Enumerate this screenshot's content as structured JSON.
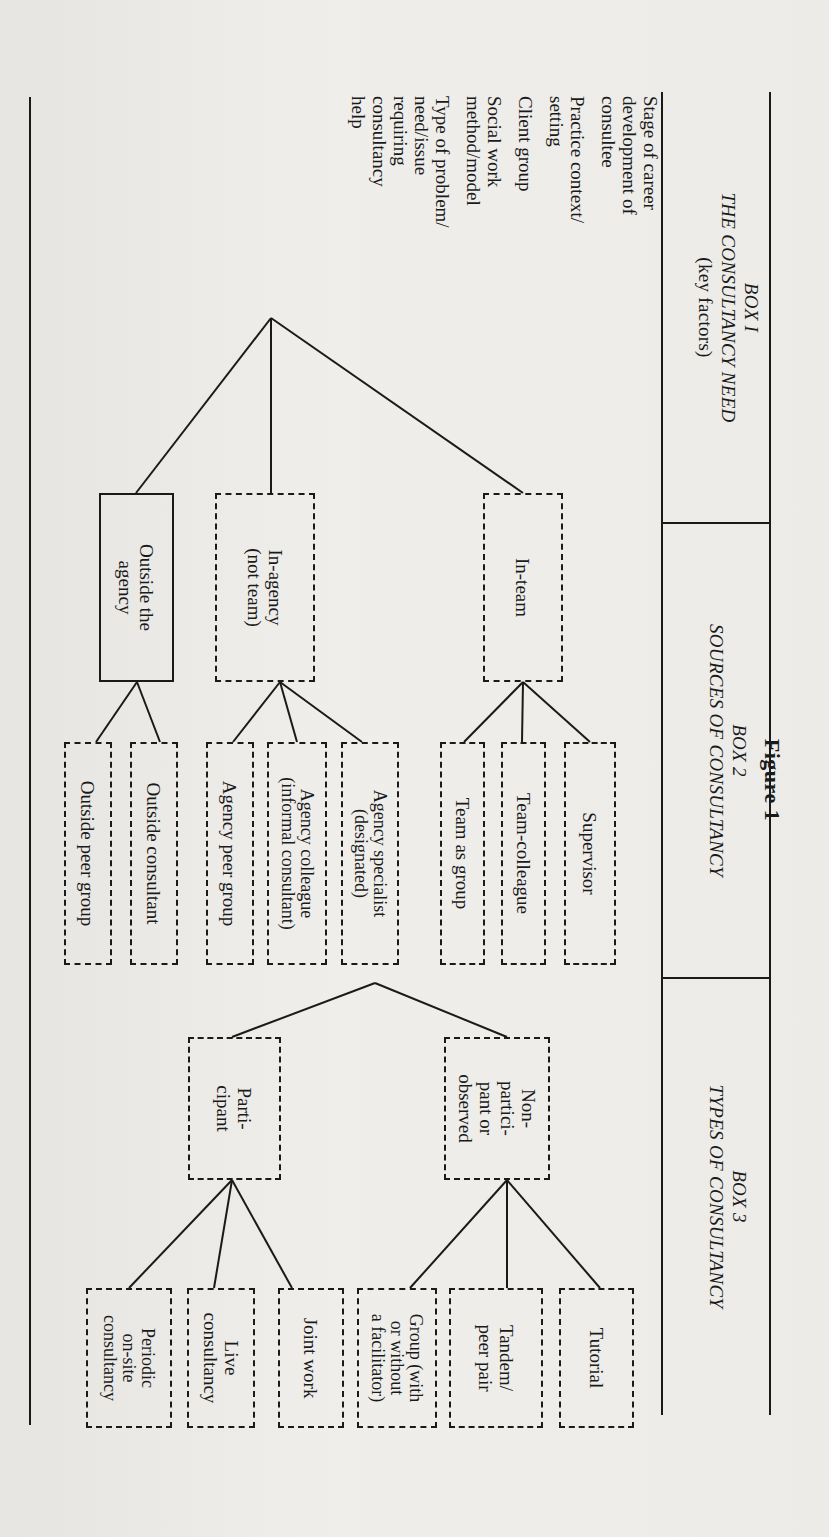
{
  "figure": {
    "title": "Figure  1"
  },
  "headers": {
    "box1": {
      "label": "BOX I",
      "title": "THE CONSULTANCY NEED",
      "subtitle": "(key factors)"
    },
    "box2": {
      "label": "BOX 2",
      "title": "SOURCES OF CONSULTANCY"
    },
    "box3": {
      "label": "BOX 3",
      "title": "TYPES OF CONSULTANCY"
    }
  },
  "box1": {
    "factors": [
      "Stage of career\ndevelopment of\nconsultee",
      "Practice context/\nsetting",
      "Client group",
      "Social work\nmethod/model",
      "Type of problem/\nneed/issue\nrequiring\nconsultancy\nhelp"
    ]
  },
  "box2": {
    "sources": [
      {
        "label": "In-team",
        "style": "dashed"
      },
      {
        "label": "In-agency\n(not team)",
        "style": "dashed"
      },
      {
        "label": "Outside the\nagency",
        "style": "solid"
      }
    ],
    "in_team": [
      "Supervisor",
      "Team-colleague",
      "Team as group"
    ],
    "in_agency": [
      "Agency specialist\n(designated)",
      "Agency colleague\n(informal consultant)",
      "Agency peer group"
    ],
    "outside": [
      "Outside consultant",
      "Outside peer group"
    ]
  },
  "box3": {
    "modes": [
      {
        "label": "Non-\npartici-\npant or\nobserved",
        "style": "dashed"
      },
      {
        "label": "Parti-\ncipant",
        "style": "dashed"
      }
    ],
    "non_participant": [
      "Tutorial",
      "Tandem/\npeer pair",
      "Group (with\nor without\na facilitator)"
    ],
    "participant": [
      "Joint work",
      "Live\nconsultancy",
      "Periodic\non-site\nconsultancy"
    ]
  },
  "colors": {
    "ink": "#1a1a1a",
    "paper": "#ecebe8"
  }
}
